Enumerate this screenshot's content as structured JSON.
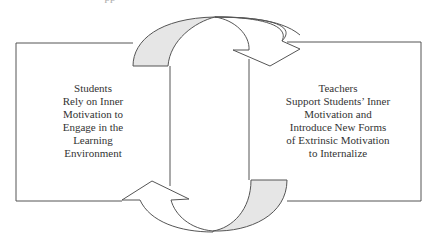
{
  "diagram": {
    "type": "cycle",
    "top_fragment": "pp",
    "colors": {
      "stroke": "#555555",
      "arrow_fill_shaded": "#e6e6e6",
      "arrow_fill_plain": "#ffffff",
      "text": "#333333"
    },
    "left_box": {
      "lines": [
        "Students",
        "Rely on Inner",
        "Motivation to",
        "Engage in the",
        "Learning",
        "Environment"
      ]
    },
    "right_box": {
      "lines": [
        "Teachers",
        "Support Students’ Inner",
        "Motivation and",
        "Introduce New Forms",
        "of Extrinsic Motivation",
        "to Internalize"
      ]
    },
    "arrows": [
      {
        "from": "left_box",
        "to": "right_box",
        "position": "top"
      },
      {
        "from": "right_box",
        "to": "left_box",
        "position": "bottom"
      }
    ]
  }
}
